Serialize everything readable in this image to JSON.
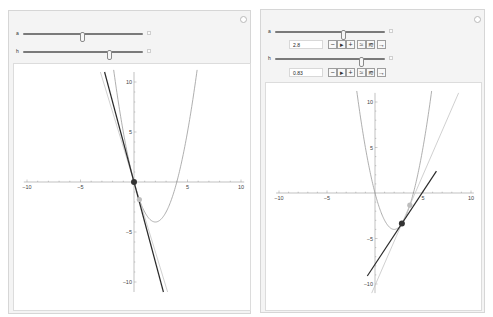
{
  "panels": [
    {
      "id": "left",
      "controls": {
        "a": {
          "label": "a",
          "slider_fraction": 0.5,
          "value": null
        },
        "h": {
          "label": "h",
          "slider_fraction": 0.72,
          "value": null
        },
        "expanded": false
      },
      "plot": {
        "function": "x^2 - 4x",
        "a": 0.0,
        "h": 0.5
      }
    },
    {
      "id": "right",
      "controls": {
        "a": {
          "label": "a",
          "slider_fraction": 0.62,
          "value": "2.8"
        },
        "h": {
          "label": "h",
          "slider_fraction": 0.78,
          "value": "0.83"
        },
        "expanded": true,
        "buttons": [
          "−",
          "▸",
          "+",
          "≈",
          "≋",
          "→"
        ]
      },
      "plot": {
        "function": "x^2 - 4x",
        "a": 2.8,
        "h": 0.83
      }
    }
  ],
  "axes": {
    "x_ticks": [
      "−10",
      "−5",
      "5",
      "10"
    ],
    "y_ticks": [
      "10",
      "5",
      "−5",
      "−10"
    ],
    "xlim": [
      -10,
      10
    ],
    "ylim": [
      -11,
      11
    ]
  },
  "colors": {
    "parabola": "#9a9a9a",
    "tangent": "#2a2a2a",
    "secant": "#c4c4c4",
    "point": "#333333",
    "secant_point": "#bdbdbd"
  }
}
